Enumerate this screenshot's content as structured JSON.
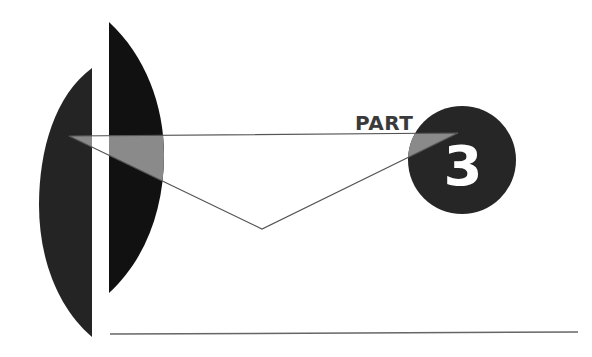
{
  "page": {
    "type": "part-divider",
    "part_label": "PART",
    "part_number": "3"
  },
  "colors": {
    "background": "#ffffff",
    "left_shape": "#242424",
    "right_shape": "#111111",
    "triangle_overlay": "#8a8a8a",
    "circle": "#262626",
    "line": "#555555",
    "number_text": "#ffffff"
  }
}
